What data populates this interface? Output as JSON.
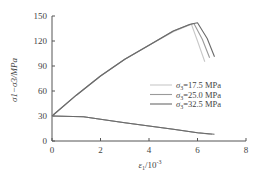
{
  "chart_data": {
    "type": "line",
    "title": "",
    "xlabel": "ε1/10^-3",
    "ylabel": "σ1−σ3/MPa",
    "xlim": [
      0,
      8
    ],
    "ylim": [
      0,
      150
    ],
    "xticks": [
      "0",
      "2",
      "4",
      "6",
      "8"
    ],
    "yticks": [
      "0",
      "30",
      "60",
      "90",
      "120",
      "150"
    ],
    "grid": false,
    "legend_position": "right-middle",
    "series": [
      {
        "name": "σ3=17.5 MPa",
        "color": "#c8c8c8",
        "deviatoric": {
          "x": [
            0,
            1,
            2,
            3,
            4,
            5,
            5.5,
            5.75,
            6.0,
            6.3
          ],
          "y": [
            30,
            55,
            78,
            98,
            115,
            131,
            137,
            140,
            120,
            95
          ]
        },
        "lateral": {
          "x": [
            0,
            1.3,
            2,
            3,
            4,
            5,
            6,
            6.5
          ],
          "y": [
            30,
            29,
            26,
            22,
            18,
            14,
            10,
            8
          ]
        }
      },
      {
        "name": "σ3=25.0 MPa",
        "color": "#9a9a9a",
        "deviatoric": {
          "x": [
            0,
            1,
            2,
            3,
            4,
            5,
            5.6,
            5.85,
            6.2,
            6.5
          ],
          "y": [
            30,
            55,
            78,
            98,
            115,
            132,
            139,
            141,
            122,
            100
          ]
        },
        "lateral": {
          "x": [
            0,
            1.3,
            2,
            3,
            4,
            5,
            6,
            6.6
          ],
          "y": [
            30,
            29,
            26,
            22,
            18,
            14,
            10,
            8
          ]
        }
      },
      {
        "name": "σ3=32.5 MPa",
        "color": "#6a6a6a",
        "deviatoric": {
          "x": [
            0,
            1,
            2,
            3,
            4,
            5,
            5.7,
            6.0,
            6.4,
            6.7
          ],
          "y": [
            30,
            55,
            78,
            98,
            115,
            132,
            140,
            142,
            123,
            101
          ]
        },
        "lateral": {
          "x": [
            0,
            1.3,
            2,
            3,
            4,
            5,
            6,
            6.7
          ],
          "y": [
            30,
            29,
            26,
            22,
            18,
            14,
            10,
            8
          ]
        }
      }
    ]
  },
  "legend": [
    {
      "label": "σ3=17.5 MPa",
      "color": "#c8c8c8"
    },
    {
      "label": "σ3=25.0 MPa",
      "color": "#9a9a9a"
    },
    {
      "label": "σ3=32.5 MPa",
      "color": "#6a6a6a"
    }
  ],
  "axes": {
    "xlabel_main": "ε",
    "xlabel_sub": "1",
    "xlabel_rest": "/10",
    "xlabel_sup": "-3",
    "ylabel": "σ1−σ3/MPa"
  }
}
